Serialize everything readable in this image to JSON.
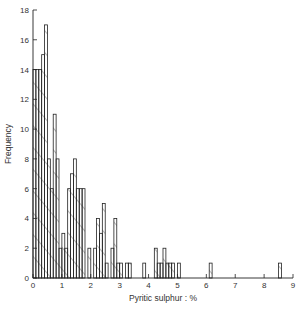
{
  "chart_data": {
    "type": "bar",
    "title": "",
    "xlabel": "Pyritic sulphur : %",
    "ylabel": "Frequency",
    "xlim": [
      0,
      9
    ],
    "ylim": [
      0,
      18
    ],
    "grid": false,
    "legend": null,
    "bin_width": 0.1,
    "x_ticks": [
      0,
      1,
      2,
      3,
      4,
      5,
      6,
      7,
      8,
      9
    ],
    "y_ticks": [
      0,
      2,
      4,
      6,
      8,
      10,
      12,
      14,
      16,
      18
    ],
    "bins": [
      {
        "start": 0.0,
        "count": 14
      },
      {
        "start": 0.1,
        "count": 14
      },
      {
        "start": 0.2,
        "count": 14
      },
      {
        "start": 0.3,
        "count": 15
      },
      {
        "start": 0.4,
        "count": 17
      },
      {
        "start": 0.5,
        "count": 8
      },
      {
        "start": 0.6,
        "count": 6
      },
      {
        "start": 0.7,
        "count": 11
      },
      {
        "start": 0.8,
        "count": 8
      },
      {
        "start": 0.9,
        "count": 2
      },
      {
        "start": 1.0,
        "count": 3
      },
      {
        "start": 1.1,
        "count": 2
      },
      {
        "start": 1.2,
        "count": 6
      },
      {
        "start": 1.3,
        "count": 7
      },
      {
        "start": 1.4,
        "count": 8
      },
      {
        "start": 1.5,
        "count": 6
      },
      {
        "start": 1.6,
        "count": 6
      },
      {
        "start": 1.7,
        "count": 6
      },
      {
        "start": 1.9,
        "count": 2
      },
      {
        "start": 2.1,
        "count": 2
      },
      {
        "start": 2.2,
        "count": 4
      },
      {
        "start": 2.3,
        "count": 3
      },
      {
        "start": 2.4,
        "count": 5
      },
      {
        "start": 2.5,
        "count": 1
      },
      {
        "start": 2.7,
        "count": 2
      },
      {
        "start": 2.8,
        "count": 4
      },
      {
        "start": 2.9,
        "count": 1
      },
      {
        "start": 3.0,
        "count": 1
      },
      {
        "start": 3.2,
        "count": 1
      },
      {
        "start": 3.3,
        "count": 1
      },
      {
        "start": 3.8,
        "count": 1
      },
      {
        "start": 4.2,
        "count": 2
      },
      {
        "start": 4.3,
        "count": 1
      },
      {
        "start": 4.4,
        "count": 1
      },
      {
        "start": 4.5,
        "count": 2
      },
      {
        "start": 4.6,
        "count": 1
      },
      {
        "start": 4.7,
        "count": 1
      },
      {
        "start": 4.8,
        "count": 1
      },
      {
        "start": 5.0,
        "count": 1
      },
      {
        "start": 6.1,
        "count": 1
      },
      {
        "start": 8.5,
        "count": 1
      }
    ]
  }
}
